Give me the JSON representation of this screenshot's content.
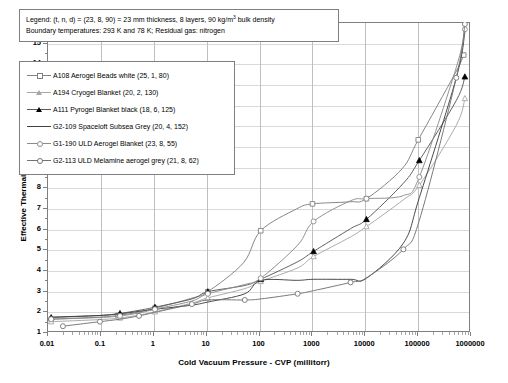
{
  "note": {
    "line1_pre": "Legend: (t, n, d) = (23, 8, 90) = 23 mm thickness, 8 layers, 90 kg/m",
    "line1_sup": "3",
    "line1_post": " bulk density",
    "line2": "Boundary temperatures: 293 K and 78 K; Residual gas: nitrogen"
  },
  "chart_data": {
    "type": "line",
    "title": "",
    "xlabel": "Cold Vacuum Pressure - CVP (millitorr)",
    "ylabel": "Effective Thermal Conductivity - kₑ (mW/m-K)",
    "xscale": "log",
    "yscale": "linear",
    "xlim": [
      0.01,
      1000000
    ],
    "ylim": [
      1,
      16
    ],
    "xticks": [
      "0.01",
      "0.1",
      "1",
      "10",
      "100",
      "1000",
      "10000",
      "100000",
      "1000000"
    ],
    "yticks": [
      "1",
      "2",
      "3",
      "4",
      "5",
      "6",
      "7",
      "8",
      "9",
      "10",
      "11",
      "12",
      "13",
      "14",
      "15",
      "16"
    ],
    "grid": true,
    "legend_position": "upper-left-inside",
    "series": [
      {
        "name": "A108 Aerogel Beads white (25, 1, 80)",
        "marker": "square-open",
        "color": "#808080",
        "x": [
          0.012,
          0.1,
          0.22,
          0.52,
          1.1,
          5.2,
          11,
          52,
          110,
          520,
          1050,
          5200,
          11000,
          52000,
          105000,
          520000,
          760000
        ],
        "y": [
          1.62,
          1.72,
          1.8,
          1.95,
          2.15,
          2.62,
          2.95,
          4.35,
          5.9,
          6.95,
          7.2,
          7.3,
          7.45,
          8.9,
          10.3,
          13.5,
          14.4
        ]
      },
      {
        "name": "A194 Cryogel Blanket (20, 2, 130)",
        "marker": "triangle-open",
        "color": "#a6a6a6",
        "x": [
          0.012,
          0.1,
          0.24,
          0.55,
          1.1,
          5.5,
          11,
          55,
          110,
          550,
          1100,
          5500,
          11000,
          55000,
          110000,
          550000,
          800000
        ],
        "y": [
          1.5,
          1.6,
          1.68,
          1.82,
          1.98,
          2.4,
          2.65,
          3.1,
          3.45,
          4.1,
          4.65,
          5.6,
          6.1,
          7.4,
          8.1,
          11.0,
          12.3
        ]
      },
      {
        "name": "A111 Pyrogel Blanket black (18, 6, 125)",
        "marker": "triangle-filled",
        "color": "#595959",
        "x": [
          0.012,
          0.1,
          0.24,
          0.55,
          1.1,
          5.5,
          11,
          55,
          110,
          550,
          1100,
          5500,
          11000,
          55000,
          110000,
          550000,
          800000
        ],
        "y": [
          1.7,
          1.8,
          1.9,
          2.05,
          2.2,
          2.6,
          2.95,
          3.25,
          3.55,
          4.4,
          4.9,
          6.0,
          6.45,
          8.2,
          9.3,
          12.2,
          13.35
        ]
      },
      {
        "name": "G2-109 Spaceloft Subsea Grey (20, 4, 152)",
        "marker": "none",
        "color": "#404040",
        "x": [
          0.012,
          0.1,
          0.24,
          0.55,
          1.1,
          5.5,
          11,
          55,
          110,
          550,
          1100,
          5500,
          11000,
          55000,
          110000,
          550000,
          800000
        ],
        "y": [
          1.72,
          1.8,
          1.88,
          2.0,
          2.1,
          2.3,
          2.45,
          2.85,
          3.5,
          3.5,
          3.55,
          3.55,
          3.6,
          5.3,
          7.5,
          13.3,
          15.5
        ]
      },
      {
        "name": "G1-190 ULD Aerogel Blanket (23, 8, 55)",
        "marker": "circle-open",
        "color": "#8c8c8c",
        "x": [
          0.012,
          0.1,
          0.24,
          0.55,
          1.1,
          5.5,
          11,
          55,
          110,
          550,
          1100,
          5500,
          11000,
          55000,
          110000,
          550000,
          800000
        ],
        "y": [
          1.62,
          1.7,
          1.78,
          1.92,
          2.1,
          2.5,
          2.85,
          3.3,
          3.6,
          5.2,
          6.35,
          7.35,
          7.45,
          7.6,
          8.5,
          13.8,
          15.65
        ]
      },
      {
        "name": "G2-113 ULD Melamine aerogel grey (21, 8, 62)",
        "marker": "circle-open",
        "color": "#737373",
        "x": [
          0.02,
          0.055,
          0.1,
          0.24,
          0.55,
          1.1,
          5.5,
          11,
          55,
          110,
          550,
          1100,
          5500,
          11000,
          55000,
          110000,
          550000,
          800000
        ],
        "y": [
          1.28,
          1.42,
          1.5,
          1.62,
          1.78,
          1.95,
          2.35,
          2.55,
          2.55,
          2.6,
          2.85,
          3.0,
          3.4,
          3.62,
          5.0,
          6.4,
          13.3,
          15.9
        ]
      }
    ]
  }
}
